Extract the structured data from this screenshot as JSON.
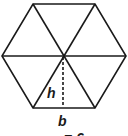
{
  "diagram": {
    "shape": "regular hexagon divided into 6 equilateral triangles",
    "labels": {
      "height": "h",
      "base": "b",
      "partial_bottom": "= 6"
    },
    "colors": {
      "stroke": "#1a1a1a",
      "background": "#ffffff"
    }
  }
}
